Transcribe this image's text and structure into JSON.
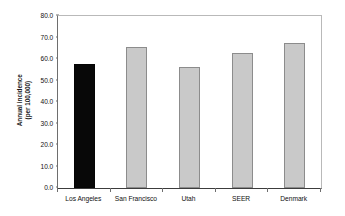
{
  "chart_data": {
    "type": "bar",
    "title": "",
    "subtitle": "",
    "xlabel": "",
    "ylabel": "Annual incidence (per 100,000)",
    "ylabel_lines": [
      "Annual incidence",
      "(per 100,000)"
    ],
    "categories": [
      "Los Angeles",
      "San Francisco",
      "Utah",
      "SEER",
      "Denmark"
    ],
    "values": [
      57.7,
      65.5,
      56.2,
      62.8,
      67.5
    ],
    "ylim": [
      0.0,
      80.0
    ],
    "ytick_step": 10.0,
    "yticks": [
      80.0,
      70.0,
      60.0,
      50.0,
      40.0,
      30.0,
      20.0,
      10.0,
      0.0
    ],
    "ytick_labels": [
      "80.0",
      "70.0",
      "60.0",
      "50.0",
      "40.0",
      "30.0",
      "20.0",
      "10.0",
      "0.0"
    ],
    "grid": false,
    "legend": false,
    "legend_position": "none",
    "bar_colors": [
      "#080808",
      "#c9c9c9",
      "#c9c9c9",
      "#c9c9c9",
      "#c9c9c9"
    ],
    "bar_border_color": "#8c8c8c",
    "highlight_category": "Los Angeles",
    "annotations": []
  },
  "style": {
    "background": "#ffffff",
    "axis_color": "#3c3c3c",
    "frame_color": "#b9b9b9",
    "tick_color": "#6e6e6e",
    "text_color": "#111111"
  }
}
